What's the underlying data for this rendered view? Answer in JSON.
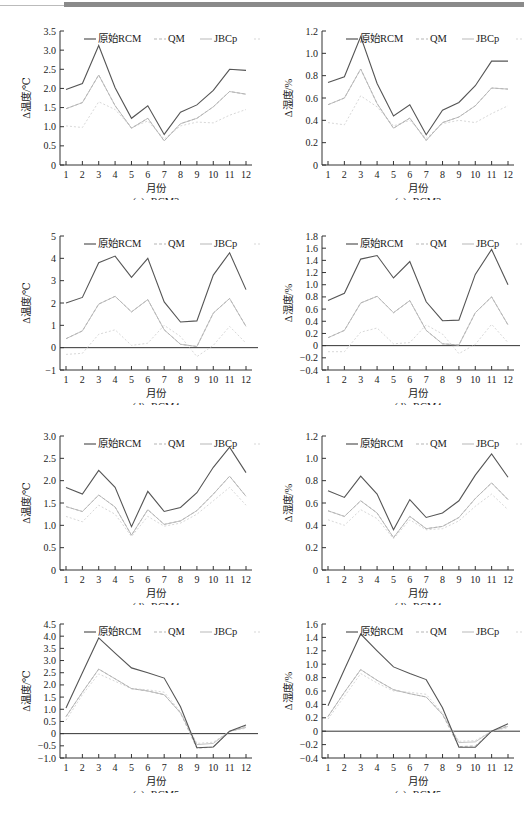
{
  "legend": [
    "原始RCM",
    "QM",
    "JBCp",
    "JBCt"
  ],
  "series_styles": [
    {
      "name": "原始RCM",
      "color": "#555555",
      "dash": "",
      "width": 1.1
    },
    {
      "name": "QM",
      "color": "#b5b5b5",
      "dash": "3,2",
      "width": 1.0
    },
    {
      "name": "JBCp",
      "color": "#c4c4c4",
      "dash": "",
      "width": 1.0
    },
    {
      "name": "JBCt",
      "color": "#d8d8d8",
      "dash": "2,2",
      "width": 1.0
    }
  ],
  "chart_data": [
    {
      "id": "c3",
      "type": "line",
      "caption": "(c)₃ RCM3",
      "xlabel": "月份",
      "ylabel": "Δ温度/℃",
      "categories": [
        1,
        2,
        3,
        4,
        5,
        6,
        7,
        8,
        9,
        10,
        11,
        12
      ],
      "ylim": [
        0,
        3.5
      ],
      "yticks": [
        0,
        0.5,
        1.0,
        1.5,
        2.0,
        2.5,
        3.0,
        3.5
      ],
      "ytick_labels": [
        "0",
        "0.5",
        "1.0",
        "1.5",
        "2.0",
        "2.5",
        "3.0",
        "3.5"
      ],
      "zero_line": false,
      "series": [
        {
          "name": "原始RCM",
          "values": [
            1.97,
            2.13,
            3.12,
            2.02,
            1.22,
            1.55,
            0.8,
            1.38,
            1.57,
            1.95,
            2.5,
            2.47
          ]
        },
        {
          "name": "QM",
          "values": [
            1.47,
            1.63,
            2.35,
            1.55,
            0.96,
            1.22,
            0.63,
            1.08,
            1.22,
            1.52,
            1.92,
            1.85
          ]
        },
        {
          "name": "JBCp",
          "values": [
            1.47,
            1.63,
            2.35,
            1.55,
            0.96,
            1.22,
            0.63,
            1.08,
            1.22,
            1.52,
            1.92,
            1.85
          ]
        },
        {
          "name": "JBCt",
          "values": [
            1.02,
            0.98,
            1.65,
            1.45,
            0.98,
            1.15,
            0.68,
            1.02,
            1.12,
            1.1,
            1.3,
            1.45
          ]
        }
      ]
    },
    {
      "id": "c4",
      "type": "line",
      "caption": "(c)₄ RCM3",
      "xlabel": "月份",
      "ylabel": "Δ湿度/%",
      "categories": [
        1,
        2,
        3,
        4,
        5,
        6,
        7,
        8,
        9,
        10,
        11,
        12
      ],
      "ylim": [
        0,
        1.2
      ],
      "yticks": [
        0,
        0.2,
        0.4,
        0.6,
        0.8,
        1.0,
        1.2
      ],
      "ytick_labels": [
        "0",
        "0.2",
        "0.4",
        "0.6",
        "0.8",
        "1.0",
        "1.2"
      ],
      "zero_line": false,
      "series": [
        {
          "name": "原始RCM",
          "values": [
            0.74,
            0.79,
            1.15,
            0.73,
            0.44,
            0.54,
            0.27,
            0.49,
            0.56,
            0.71,
            0.93,
            0.93
          ]
        },
        {
          "name": "QM",
          "values": [
            0.54,
            0.6,
            0.86,
            0.55,
            0.33,
            0.42,
            0.22,
            0.38,
            0.43,
            0.53,
            0.69,
            0.68
          ]
        },
        {
          "name": "JBCp",
          "values": [
            0.54,
            0.6,
            0.86,
            0.55,
            0.33,
            0.42,
            0.22,
            0.38,
            0.43,
            0.53,
            0.69,
            0.68
          ]
        },
        {
          "name": "JBCt",
          "values": [
            0.38,
            0.36,
            0.62,
            0.52,
            0.35,
            0.4,
            0.24,
            0.37,
            0.4,
            0.38,
            0.46,
            0.53
          ]
        }
      ]
    },
    {
      "id": "d1",
      "type": "line",
      "caption": "(d)₁ RCM4",
      "xlabel": "月份",
      "ylabel": "Δ温度/℃",
      "categories": [
        1,
        2,
        3,
        4,
        5,
        6,
        7,
        8,
        9,
        10,
        11,
        12
      ],
      "ylim": [
        -1,
        5
      ],
      "yticks": [
        -1,
        0,
        1,
        2,
        3,
        4,
        5
      ],
      "ytick_labels": [
        "−1",
        "0",
        "1",
        "2",
        "3",
        "4",
        "5"
      ],
      "zero_line": true,
      "series": [
        {
          "name": "原始RCM",
          "values": [
            2.0,
            2.25,
            3.8,
            4.1,
            3.15,
            4.0,
            2.05,
            1.15,
            1.2,
            3.25,
            4.25,
            2.6
          ]
        },
        {
          "name": "QM",
          "values": [
            0.4,
            0.75,
            1.95,
            2.3,
            1.6,
            2.15,
            0.8,
            0.15,
            0.05,
            1.55,
            2.2,
            0.95
          ]
        },
        {
          "name": "JBCp",
          "values": [
            0.4,
            0.75,
            1.95,
            2.3,
            1.6,
            2.15,
            0.8,
            0.15,
            0.05,
            1.55,
            2.2,
            0.95
          ]
        },
        {
          "name": "JBCt",
          "values": [
            -0.3,
            -0.25,
            0.6,
            0.8,
            0.1,
            0.2,
            1.0,
            0.5,
            -0.4,
            0.1,
            0.95,
            0.2
          ]
        }
      ]
    },
    {
      "id": "d2",
      "type": "line",
      "caption": "(d)₂ RCM4",
      "xlabel": "月份",
      "ylabel": "Δ湿度/%",
      "categories": [
        1,
        2,
        3,
        4,
        5,
        6,
        7,
        8,
        9,
        10,
        11,
        12
      ],
      "ylim": [
        -0.4,
        1.8
      ],
      "yticks": [
        -0.4,
        -0.2,
        0,
        0.2,
        0.4,
        0.6,
        0.8,
        1.0,
        1.2,
        1.4,
        1.6,
        1.8
      ],
      "ytick_labels": [
        "−0.4",
        "−0.2",
        "0",
        "0.2",
        "0.4",
        "0.6",
        "0.8",
        "1.0",
        "1.2",
        "1.4",
        "1.6",
        "1.8"
      ],
      "zero_line": true,
      "series": [
        {
          "name": "原始RCM",
          "values": [
            0.74,
            0.86,
            1.42,
            1.48,
            1.11,
            1.38,
            0.72,
            0.41,
            0.42,
            1.17,
            1.58,
            1.0
          ]
        },
        {
          "name": "QM",
          "values": [
            0.13,
            0.25,
            0.7,
            0.81,
            0.54,
            0.74,
            0.25,
            0.03,
            0.01,
            0.54,
            0.8,
            0.34
          ]
        },
        {
          "name": "JBCp",
          "values": [
            0.13,
            0.25,
            0.7,
            0.81,
            0.54,
            0.74,
            0.25,
            0.03,
            0.01,
            0.54,
            0.8,
            0.34
          ]
        },
        {
          "name": "JBCt",
          "values": [
            -0.1,
            -0.1,
            0.22,
            0.29,
            0.03,
            0.05,
            0.34,
            0.19,
            -0.13,
            0.02,
            0.35,
            0.05
          ]
        }
      ]
    },
    {
      "id": "d3",
      "type": "line",
      "caption": "(d)₃ RCM4",
      "xlabel": "月份",
      "ylabel": "Δ温度/℃",
      "categories": [
        1,
        2,
        3,
        4,
        5,
        6,
        7,
        8,
        9,
        10,
        11,
        12
      ],
      "ylim": [
        0,
        3.0
      ],
      "yticks": [
        0,
        0.5,
        1.0,
        1.5,
        2.0,
        2.5,
        3.0
      ],
      "ytick_labels": [
        "0",
        "0.5",
        "1.0",
        "1.5",
        "2.0",
        "2.5",
        "3.0"
      ],
      "zero_line": false,
      "series": [
        {
          "name": "原始RCM",
          "values": [
            1.85,
            1.7,
            2.23,
            1.85,
            0.97,
            1.76,
            1.31,
            1.4,
            1.73,
            2.3,
            2.75,
            2.18
          ]
        },
        {
          "name": "QM",
          "values": [
            1.42,
            1.31,
            1.68,
            1.41,
            0.78,
            1.35,
            1.02,
            1.1,
            1.33,
            1.7,
            2.1,
            1.65
          ]
        },
        {
          "name": "JBCp",
          "values": [
            1.42,
            1.31,
            1.68,
            1.41,
            0.78,
            1.35,
            1.02,
            1.1,
            1.33,
            1.7,
            2.1,
            1.65
          ]
        },
        {
          "name": "JBCt",
          "values": [
            1.2,
            1.08,
            1.45,
            1.25,
            0.75,
            1.2,
            0.98,
            1.05,
            1.25,
            1.55,
            1.85,
            1.45
          ]
        }
      ]
    },
    {
      "id": "d4",
      "type": "line",
      "caption": "(d)₄ RCM4",
      "xlabel": "月份",
      "ylabel": "Δ湿度/%",
      "categories": [
        1,
        2,
        3,
        4,
        5,
        6,
        7,
        8,
        9,
        10,
        11,
        12
      ],
      "ylim": [
        0,
        1.2
      ],
      "yticks": [
        0,
        0.2,
        0.4,
        0.6,
        0.8,
        1.0,
        1.2
      ],
      "ytick_labels": [
        "0",
        "0.2",
        "0.4",
        "0.6",
        "0.8",
        "1.0",
        "1.2"
      ],
      "zero_line": false,
      "series": [
        {
          "name": "原始RCM",
          "values": [
            0.71,
            0.65,
            0.84,
            0.68,
            0.36,
            0.63,
            0.47,
            0.51,
            0.62,
            0.85,
            1.04,
            0.83
          ]
        },
        {
          "name": "QM",
          "values": [
            0.53,
            0.48,
            0.62,
            0.51,
            0.29,
            0.48,
            0.37,
            0.39,
            0.47,
            0.64,
            0.78,
            0.63
          ]
        },
        {
          "name": "JBCp",
          "values": [
            0.53,
            0.48,
            0.62,
            0.51,
            0.29,
            0.48,
            0.37,
            0.39,
            0.47,
            0.64,
            0.78,
            0.63
          ]
        },
        {
          "name": "JBCt",
          "values": [
            0.45,
            0.4,
            0.54,
            0.46,
            0.28,
            0.45,
            0.36,
            0.37,
            0.44,
            0.57,
            0.68,
            0.54
          ]
        }
      ]
    },
    {
      "id": "e1",
      "type": "line",
      "caption": "(e)₁ RCM5",
      "xlabel": "月份",
      "ylabel": "Δ温度/℃",
      "categories": [
        1,
        2,
        3,
        4,
        5,
        6,
        7,
        8,
        9,
        10,
        11,
        12
      ],
      "ylim": [
        -1.0,
        4.5
      ],
      "yticks": [
        -1.0,
        -0.5,
        0,
        0.5,
        1.0,
        1.5,
        2.0,
        2.5,
        3.0,
        3.5,
        4.0,
        4.5
      ],
      "ytick_labels": [
        "−1.0",
        "−0.5",
        "0",
        "0.5",
        "1.0",
        "1.5",
        "2.0",
        "2.5",
        "3.0",
        "3.5",
        "4.0",
        "4.5"
      ],
      "zero_line": true,
      "series": [
        {
          "name": "原始RCM",
          "values": [
            1.05,
            2.5,
            3.93,
            3.3,
            2.7,
            2.5,
            2.28,
            1.1,
            -0.58,
            -0.55,
            0.1,
            0.35
          ]
        },
        {
          "name": "QM",
          "values": [
            0.7,
            1.7,
            2.65,
            2.25,
            1.85,
            1.75,
            1.6,
            0.85,
            -0.6,
            -0.55,
            0.08,
            0.3
          ]
        },
        {
          "name": "JBCp",
          "values": [
            0.7,
            1.7,
            2.65,
            2.25,
            1.85,
            1.75,
            1.6,
            0.85,
            -0.45,
            -0.4,
            0.1,
            0.25
          ]
        },
        {
          "name": "JBCt",
          "values": [
            0.55,
            1.6,
            2.45,
            2.15,
            1.85,
            1.8,
            1.7,
            0.9,
            -0.4,
            -0.35,
            0.1,
            0.22
          ]
        }
      ]
    },
    {
      "id": "e2",
      "type": "line",
      "caption": "(e)₂ RCM5",
      "xlabel": "月份",
      "ylabel": "Δ湿度/%",
      "categories": [
        1,
        2,
        3,
        4,
        5,
        6,
        7,
        8,
        9,
        10,
        11,
        12
      ],
      "ylim": [
        -0.4,
        1.6
      ],
      "yticks": [
        -0.4,
        -0.2,
        0,
        0.2,
        0.4,
        0.6,
        0.8,
        1.0,
        1.2,
        1.4,
        1.6
      ],
      "ytick_labels": [
        "−0.4",
        "−0.2",
        "0",
        "0.2",
        "0.4",
        "0.6",
        "0.8",
        "1.0",
        "1.2",
        "1.4",
        "1.6"
      ],
      "zero_line": true,
      "series": [
        {
          "name": "原始RCM",
          "values": [
            0.38,
            0.92,
            1.45,
            1.2,
            0.96,
            0.86,
            0.77,
            0.35,
            -0.24,
            -0.24,
            0.0,
            0.11
          ]
        },
        {
          "name": "QM",
          "values": [
            0.22,
            0.58,
            0.92,
            0.76,
            0.62,
            0.56,
            0.51,
            0.25,
            -0.23,
            -0.22,
            0.0,
            0.08
          ]
        },
        {
          "name": "JBCp",
          "values": [
            0.22,
            0.58,
            0.92,
            0.76,
            0.62,
            0.56,
            0.51,
            0.25,
            -0.17,
            -0.16,
            0.0,
            0.07
          ]
        },
        {
          "name": "JBCt",
          "values": [
            0.18,
            0.52,
            0.86,
            0.72,
            0.6,
            0.58,
            0.55,
            0.27,
            -0.15,
            -0.14,
            0.0,
            0.05
          ]
        }
      ]
    }
  ]
}
